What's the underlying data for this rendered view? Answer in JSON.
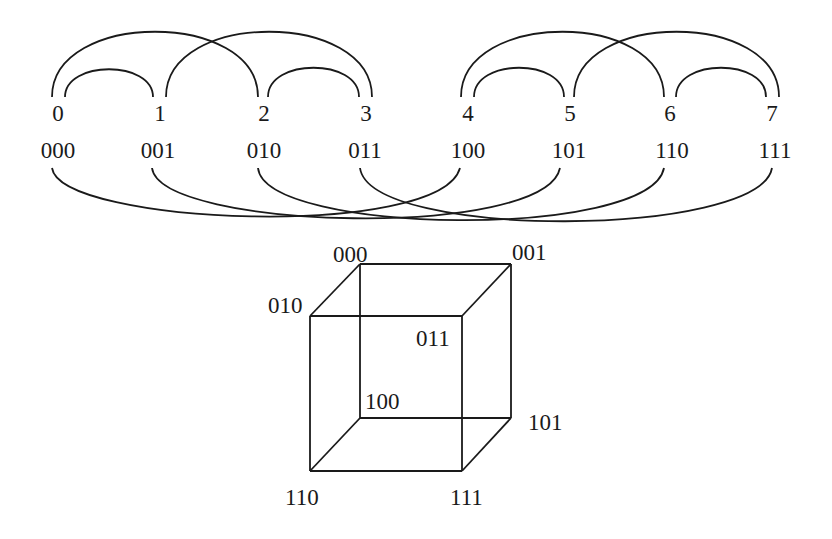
{
  "line_nodes": [
    {
      "index": "0",
      "binary": "000"
    },
    {
      "index": "1",
      "binary": "001"
    },
    {
      "index": "2",
      "binary": "010"
    },
    {
      "index": "3",
      "binary": "011"
    },
    {
      "index": "4",
      "binary": "100"
    },
    {
      "index": "5",
      "binary": "101"
    },
    {
      "index": "6",
      "binary": "110"
    },
    {
      "index": "7",
      "binary": "111"
    }
  ],
  "top_arcs": [
    {
      "from": "0",
      "to": "1",
      "dimension": 1
    },
    {
      "from": "2",
      "to": "3",
      "dimension": 1
    },
    {
      "from": "4",
      "to": "5",
      "dimension": 1
    },
    {
      "from": "6",
      "to": "7",
      "dimension": 1
    },
    {
      "from": "0",
      "to": "2",
      "dimension": 2
    },
    {
      "from": "1",
      "to": "3",
      "dimension": 2
    },
    {
      "from": "4",
      "to": "6",
      "dimension": 2
    },
    {
      "from": "5",
      "to": "7",
      "dimension": 2
    }
  ],
  "bottom_arcs": [
    {
      "from": "000",
      "to": "100"
    },
    {
      "from": "001",
      "to": "101"
    },
    {
      "from": "010",
      "to": "110"
    },
    {
      "from": "011",
      "to": "111"
    }
  ],
  "cube": {
    "vertices": {
      "v000": "000",
      "v001": "001",
      "v010": "010",
      "v011": "011",
      "v100": "100",
      "v101": "101",
      "v110": "110",
      "v111": "111"
    }
  }
}
